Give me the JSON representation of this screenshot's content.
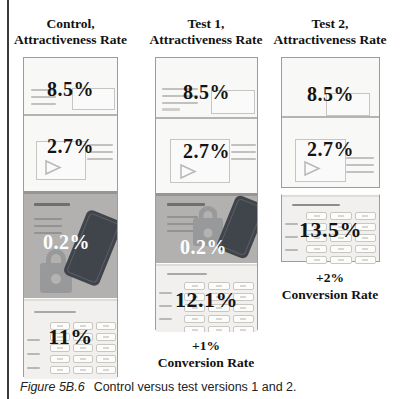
{
  "page": {
    "caption": {
      "label": "Figure 5B.6",
      "text": "Control versus test versions 1 and 2."
    }
  },
  "columns": [
    {
      "header_line1": "Control,",
      "header_line2": "Attractiveness Rate",
      "email_rate": "8.5%",
      "video_rate": "2.7%",
      "security_rate": "0.2%",
      "form_rate": "11%"
    },
    {
      "header_line1": "Test 1,",
      "header_line2": "Attractiveness Rate",
      "email_rate": "8.5%",
      "video_rate": "2.7%",
      "security_rate": "0.2%",
      "form_rate": "12.1%",
      "conversion_delta": "+1%",
      "conversion_label": "Conversion Rate"
    },
    {
      "header_line1": "Test 2,",
      "header_line2": "Attractiveness Rate",
      "email_rate": "8.5%",
      "video_rate": "2.7%",
      "form_rate": "13.5%",
      "conversion_delta": "+2%",
      "conversion_label": "Conversion Rate"
    }
  ],
  "colors": {
    "panel_gray": "#b2b1b0",
    "panel_gray_shadow": "#969594",
    "phone": "#40444b",
    "lock": "#98999b",
    "keypad_bg": "#f1f0ee",
    "panel_bg": "#f8f8f7",
    "border": "#9c9c9c",
    "stat_text": "#141414"
  }
}
